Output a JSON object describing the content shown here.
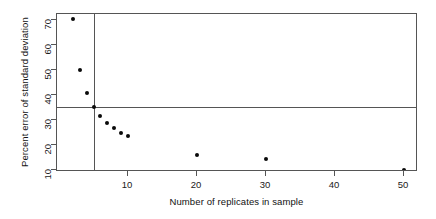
{
  "chart_data": {
    "type": "scatter",
    "title": "",
    "subtitle": "",
    "xlabel": "Number of replicates in sample",
    "ylabel": "Percent error of standard deviation",
    "xlim": [
      0,
      52
    ],
    "ylim": [
      8.5,
      73
    ],
    "grid": false,
    "legend": "none",
    "x": [
      2,
      3,
      4,
      5,
      6,
      7,
      8,
      9,
      10,
      20,
      30,
      50
    ],
    "y": [
      70.5,
      50.0,
      41.0,
      35.2,
      31.5,
      29.0,
      27.0,
      25.0,
      23.5,
      16.0,
      14.3,
      10.2
    ],
    "points": [
      {
        "x": 2,
        "y": 70.5
      },
      {
        "x": 3,
        "y": 50.0
      },
      {
        "x": 4,
        "y": 41.0
      },
      {
        "x": 5,
        "y": 35.2
      },
      {
        "x": 6,
        "y": 31.5
      },
      {
        "x": 7,
        "y": 29.0
      },
      {
        "x": 8,
        "y": 27.0
      },
      {
        "x": 9,
        "y": 25.0
      },
      {
        "x": 10,
        "y": 23.5
      },
      {
        "x": 20,
        "y": 16.0
      },
      {
        "x": 30,
        "y": 14.3
      },
      {
        "x": 50,
        "y": 10.2
      }
    ],
    "xticks": [
      10,
      20,
      30,
      40,
      50
    ],
    "xtick_labels": [
      "10",
      "20",
      "30",
      "40",
      "50"
    ],
    "yticks": [
      10,
      20,
      30,
      40,
      50,
      60,
      70
    ],
    "ytick_labels": [
      "10",
      "20",
      "30",
      "40",
      "50",
      "60",
      "70"
    ],
    "reference_lines": [
      {
        "orientation": "vertical",
        "value": 5,
        "label": ""
      },
      {
        "orientation": "horizontal",
        "value": 35.2,
        "label": ""
      }
    ],
    "colors": {
      "point": "#0a0a0a",
      "axis": "#555555",
      "reference_line": "#555555",
      "background": "#ffffff",
      "text": "#111111"
    },
    "marker": {
      "shape": "filled-circle",
      "size_px": 4
    }
  }
}
